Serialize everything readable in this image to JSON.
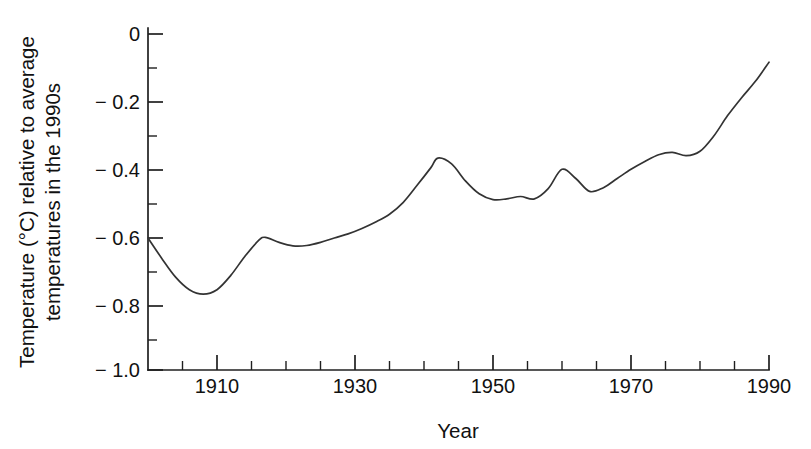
{
  "chart_data": {
    "type": "line",
    "title": "",
    "subtitle": "",
    "xlabel": "Year",
    "ylabel": "Temperature (°C) relative to average temperatures in the 1990s",
    "ylabel_line1": "Temperature (°C) relative to average",
    "ylabel_line2": "temperatures in the 1990s",
    "xlim": [
      1900,
      1990
    ],
    "ylim": [
      -1.0,
      0.0
    ],
    "grid": false,
    "legend": false,
    "legend_position": "none",
    "line_color": "#333333",
    "x_major_ticks": [
      1910,
      1930,
      1950,
      1970,
      1990
    ],
    "x_major_tick_labels": [
      "1910",
      "1930",
      "1950",
      "1970",
      "1990"
    ],
    "x_minor_ticks": [
      1905,
      1915,
      1920,
      1925,
      1935,
      1940,
      1945,
      1955,
      1960,
      1965,
      1975,
      1980,
      1985
    ],
    "y_major_ticks": [
      0,
      -0.2,
      -0.4,
      -0.6,
      -0.8,
      -1.0
    ],
    "y_major_tick_labels": [
      "0",
      "− 0.2",
      "− 0.4",
      "− 0.6",
      "− 0.8",
      "− 1.0"
    ],
    "y_minor_ticks": [
      -0.1,
      -0.3,
      -0.5,
      -0.7,
      -0.9
    ],
    "x": [
      1900,
      1902,
      1904,
      1906,
      1908,
      1910,
      1912,
      1914,
      1916,
      1917,
      1919,
      1921,
      1923,
      1925,
      1927,
      1929,
      1931,
      1933,
      1935,
      1937,
      1939,
      1941,
      1942,
      1944,
      1946,
      1948,
      1950,
      1952,
      1954,
      1956,
      1958,
      1960,
      1962,
      1964,
      1966,
      1968,
      1970,
      1972,
      1974,
      1976,
      1978,
      1980,
      1982,
      1984,
      1986,
      1988,
      1990
    ],
    "values": [
      -0.6,
      -0.66,
      -0.715,
      -0.752,
      -0.765,
      -0.752,
      -0.71,
      -0.655,
      -0.608,
      -0.598,
      -0.613,
      -0.623,
      -0.622,
      -0.613,
      -0.6,
      -0.588,
      -0.572,
      -0.553,
      -0.53,
      -0.495,
      -0.445,
      -0.393,
      -0.365,
      -0.382,
      -0.432,
      -0.47,
      -0.487,
      -0.485,
      -0.478,
      -0.485,
      -0.455,
      -0.398,
      -0.425,
      -0.463,
      -0.452,
      -0.425,
      -0.398,
      -0.375,
      -0.355,
      -0.348,
      -0.358,
      -0.345,
      -0.3,
      -0.24,
      -0.188,
      -0.14,
      -0.083
    ],
    "notes": {
      "start_value": -0.6,
      "minimum": {
        "year": 1908,
        "value": -0.765
      },
      "peak_1940s": {
        "year": 1942,
        "value": -0.365
      },
      "peak_1960": {
        "year": 1960,
        "value": -0.398
      },
      "end_value": -0.083
    }
  },
  "axis": {
    "x_title": "Year",
    "y_title_line1": "Temperature (°C) relative to average",
    "y_title_line2": "temperatures in the 1990s"
  }
}
